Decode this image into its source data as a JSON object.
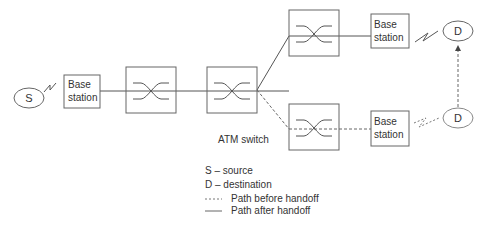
{
  "diagram": {
    "type": "ATM network handoff",
    "nodes": {
      "source": {
        "label": "S"
      },
      "dest_top": {
        "label": "D"
      },
      "dest_bottom": {
        "label": "D"
      },
      "bs_left": {
        "line1": "Base",
        "line2": "station"
      },
      "bs_top": {
        "line1": "Base",
        "line2": "station"
      },
      "bs_bottom": {
        "line1": "Base",
        "line2": "station"
      }
    },
    "switch_label": "ATM switch",
    "legend": {
      "s": "S – source",
      "d": "D – destination",
      "before": "Path before handoff",
      "after": "Path after handoff"
    },
    "colors": {
      "line": "#555555",
      "text": "#333333",
      "box": "#666666"
    }
  }
}
